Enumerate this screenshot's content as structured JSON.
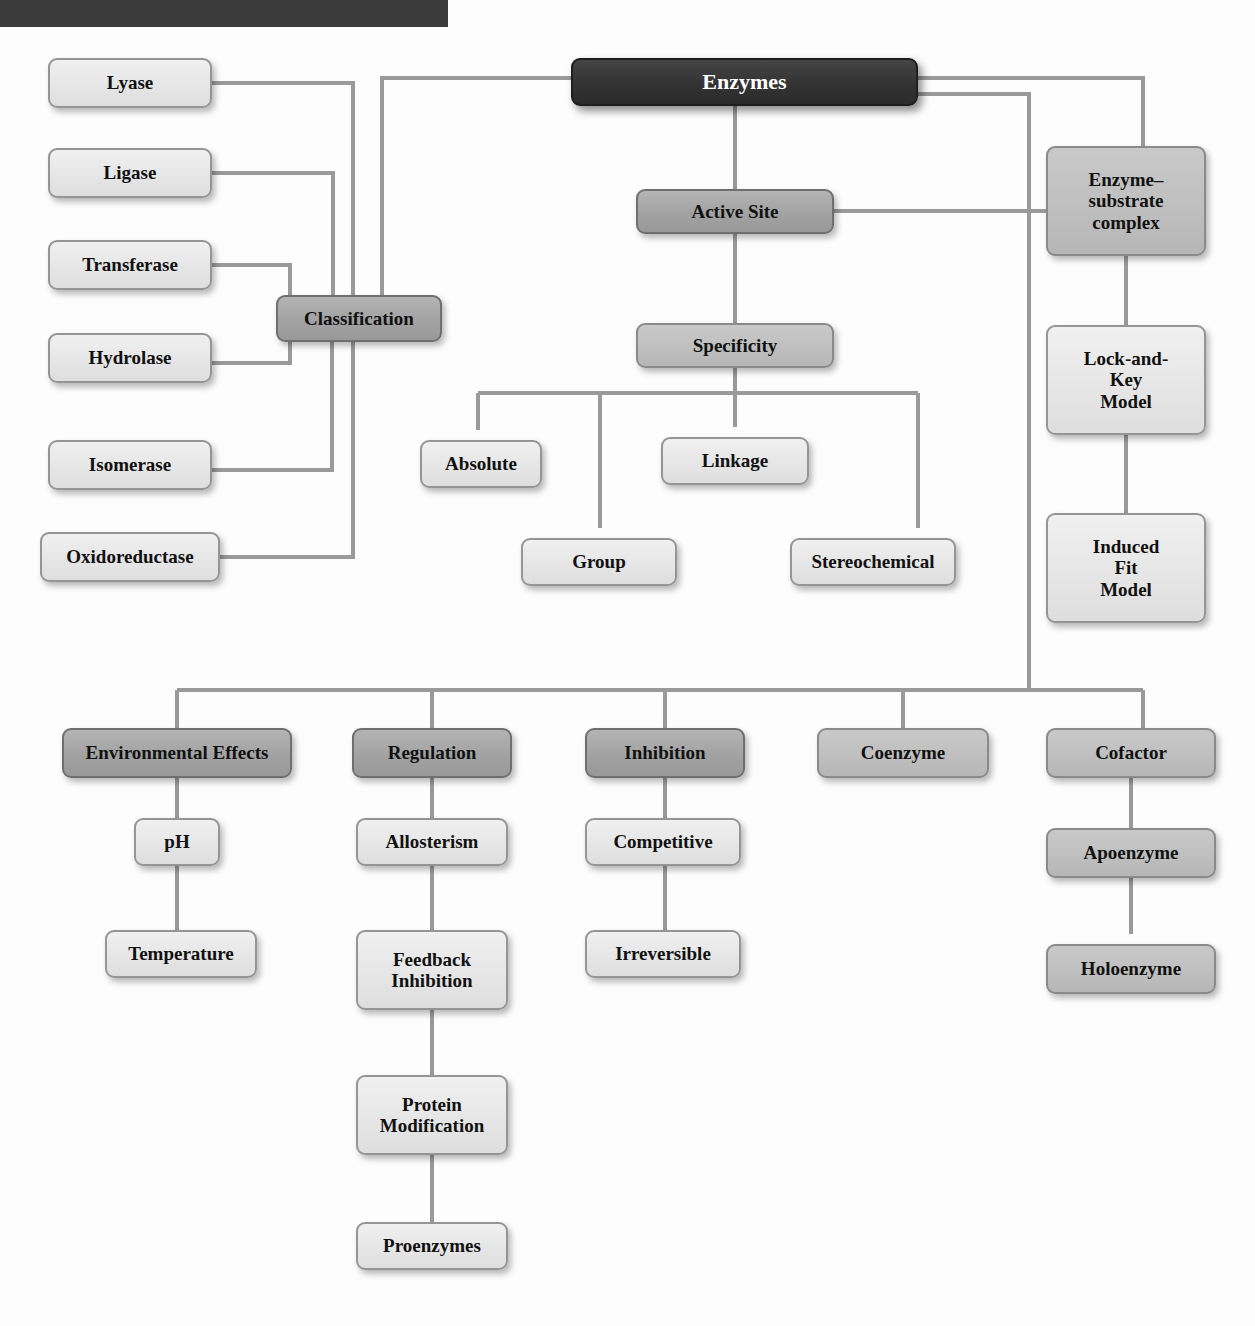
{
  "diagram": {
    "title_banner": "",
    "colors": {
      "root_fill": "#333333",
      "dark_fill": "#a2a2a2",
      "mid_fill": "#bfbfbf",
      "light_fill": "#e6e6e6",
      "connector": "#9a9a9a",
      "border": "#8e8e8e",
      "text": "#111111",
      "root_text": "#ffffff",
      "banner": "#3b3b3b"
    },
    "nodes": [
      {
        "id": "enzymes",
        "label": "Enzymes",
        "tone": "root",
        "x": 571,
        "y": 58,
        "w": 347,
        "h": 48,
        "fs": 22
      },
      {
        "id": "lyase",
        "label": "Lyase",
        "tone": "light",
        "x": 48,
        "y": 58,
        "w": 164,
        "h": 50,
        "fs": 19
      },
      {
        "id": "ligase",
        "label": "Ligase",
        "tone": "light",
        "x": 48,
        "y": 148,
        "w": 164,
        "h": 50,
        "fs": 19
      },
      {
        "id": "transferase",
        "label": "Transferase",
        "tone": "light",
        "x": 48,
        "y": 240,
        "w": 164,
        "h": 50,
        "fs": 19
      },
      {
        "id": "hydrolase",
        "label": "Hydrolase",
        "tone": "light",
        "x": 48,
        "y": 333,
        "w": 164,
        "h": 50,
        "fs": 19
      },
      {
        "id": "isomerase",
        "label": "Isomerase",
        "tone": "light",
        "x": 48,
        "y": 440,
        "w": 164,
        "h": 50,
        "fs": 19
      },
      {
        "id": "oxidoreductase",
        "label": "Oxidoreductase",
        "tone": "light",
        "x": 40,
        "y": 532,
        "w": 180,
        "h": 50,
        "fs": 19
      },
      {
        "id": "classification",
        "label": "Classification",
        "tone": "dark",
        "x": 276,
        "y": 295,
        "w": 166,
        "h": 47,
        "fs": 19
      },
      {
        "id": "active-site",
        "label": "Active Site",
        "tone": "dark",
        "x": 636,
        "y": 189,
        "w": 198,
        "h": 45,
        "fs": 19
      },
      {
        "id": "specificity",
        "label": "Specificity",
        "tone": "mid",
        "x": 636,
        "y": 323,
        "w": 198,
        "h": 45,
        "fs": 19
      },
      {
        "id": "absolute",
        "label": "Absolute",
        "tone": "light",
        "x": 420,
        "y": 440,
        "w": 122,
        "h": 48,
        "fs": 19
      },
      {
        "id": "linkage",
        "label": "Linkage",
        "tone": "light",
        "x": 661,
        "y": 437,
        "w": 148,
        "h": 48,
        "fs": 19
      },
      {
        "id": "group",
        "label": "Group",
        "tone": "light",
        "x": 521,
        "y": 538,
        "w": 156,
        "h": 48,
        "fs": 19
      },
      {
        "id": "stereochemical",
        "label": "Stereochemical",
        "tone": "light",
        "x": 790,
        "y": 538,
        "w": 166,
        "h": 48,
        "fs": 19
      },
      {
        "id": "enzyme-substrate",
        "label": "Enzyme–\nsubstrate\ncomplex",
        "tone": "mid",
        "x": 1046,
        "y": 146,
        "w": 160,
        "h": 110,
        "fs": 19
      },
      {
        "id": "lock-and-key",
        "label": "Lock-and-\nKey\nModel",
        "tone": "light",
        "x": 1046,
        "y": 325,
        "w": 160,
        "h": 110,
        "fs": 19
      },
      {
        "id": "induced-fit",
        "label": "Induced\nFit\nModel",
        "tone": "light",
        "x": 1046,
        "y": 513,
        "w": 160,
        "h": 110,
        "fs": 19
      },
      {
        "id": "environmental-effects",
        "label": "Environmental Effects",
        "tone": "dark",
        "x": 62,
        "y": 728,
        "w": 230,
        "h": 50,
        "fs": 19
      },
      {
        "id": "ph",
        "label": "pH",
        "tone": "light",
        "x": 134,
        "y": 818,
        "w": 86,
        "h": 48,
        "fs": 19
      },
      {
        "id": "temperature",
        "label": "Temperature",
        "tone": "light",
        "x": 105,
        "y": 930,
        "w": 152,
        "h": 48,
        "fs": 19
      },
      {
        "id": "regulation",
        "label": "Regulation",
        "tone": "dark",
        "x": 352,
        "y": 728,
        "w": 160,
        "h": 50,
        "fs": 19
      },
      {
        "id": "allosterism",
        "label": "Allosterism",
        "tone": "light",
        "x": 356,
        "y": 818,
        "w": 152,
        "h": 48,
        "fs": 19
      },
      {
        "id": "feedback-inhibition",
        "label": "Feedback\nInhibition",
        "tone": "light",
        "x": 356,
        "y": 930,
        "w": 152,
        "h": 80,
        "fs": 19
      },
      {
        "id": "protein-modification",
        "label": "Protein\nModification",
        "tone": "light",
        "x": 356,
        "y": 1075,
        "w": 152,
        "h": 80,
        "fs": 19
      },
      {
        "id": "proenzymes",
        "label": "Proenzymes",
        "tone": "light",
        "x": 356,
        "y": 1222,
        "w": 152,
        "h": 48,
        "fs": 19
      },
      {
        "id": "inhibition",
        "label": "Inhibition",
        "tone": "dark",
        "x": 585,
        "y": 728,
        "w": 160,
        "h": 50,
        "fs": 19
      },
      {
        "id": "competitive",
        "label": "Competitive",
        "tone": "light",
        "x": 585,
        "y": 818,
        "w": 156,
        "h": 48,
        "fs": 19
      },
      {
        "id": "irreversible",
        "label": "Irreversible",
        "tone": "light",
        "x": 585,
        "y": 930,
        "w": 156,
        "h": 48,
        "fs": 19
      },
      {
        "id": "coenzyme",
        "label": "Coenzyme",
        "tone": "mid",
        "x": 817,
        "y": 728,
        "w": 172,
        "h": 50,
        "fs": 19
      },
      {
        "id": "cofactor",
        "label": "Cofactor",
        "tone": "mid",
        "x": 1046,
        "y": 728,
        "w": 170,
        "h": 50,
        "fs": 19
      },
      {
        "id": "apoenzyme",
        "label": "Apoenzyme",
        "tone": "mid",
        "x": 1046,
        "y": 828,
        "w": 170,
        "h": 50,
        "fs": 19
      },
      {
        "id": "holoenzyme",
        "label": "Holoenzyme",
        "tone": "mid",
        "x": 1046,
        "y": 944,
        "w": 170,
        "h": 50,
        "fs": 19
      }
    ],
    "edges": [
      {
        "from": "lyase",
        "to": "classification",
        "arrow": false
      },
      {
        "from": "ligase",
        "to": "classification",
        "arrow": false
      },
      {
        "from": "transferase",
        "to": "classification",
        "arrow": false
      },
      {
        "from": "hydrolase",
        "to": "classification",
        "arrow": false
      },
      {
        "from": "isomerase",
        "to": "classification",
        "arrow": false
      },
      {
        "from": "oxidoreductase",
        "to": "classification",
        "arrow": false
      },
      {
        "from": "enzymes",
        "to": "classification",
        "arrow": false
      },
      {
        "from": "enzymes",
        "to": "active-site",
        "arrow": false
      },
      {
        "from": "enzymes",
        "to": "enzyme-substrate",
        "arrow": false
      },
      {
        "from": "enzymes",
        "to": "bottom-bus",
        "arrow": false
      },
      {
        "from": "active-site",
        "to": "specificity",
        "arrow": false
      },
      {
        "from": "active-site",
        "to": "enzyme-substrate",
        "arrow": false
      },
      {
        "from": "specificity",
        "to": "absolute",
        "arrow": true
      },
      {
        "from": "specificity",
        "to": "group",
        "arrow": true
      },
      {
        "from": "specificity",
        "to": "linkage",
        "arrow": true
      },
      {
        "from": "specificity",
        "to": "stereochemical",
        "arrow": true
      },
      {
        "from": "enzyme-substrate",
        "to": "lock-and-key",
        "arrow": false
      },
      {
        "from": "lock-and-key",
        "to": "induced-fit",
        "arrow": false
      },
      {
        "from": "bottom-bus",
        "to": "environmental-effects",
        "arrow": false
      },
      {
        "from": "bottom-bus",
        "to": "regulation",
        "arrow": false
      },
      {
        "from": "bottom-bus",
        "to": "inhibition",
        "arrow": false
      },
      {
        "from": "bottom-bus",
        "to": "coenzyme",
        "arrow": false
      },
      {
        "from": "bottom-bus",
        "to": "cofactor",
        "arrow": false
      },
      {
        "from": "environmental-effects",
        "to": "ph",
        "arrow": false
      },
      {
        "from": "ph",
        "to": "temperature",
        "arrow": false
      },
      {
        "from": "regulation",
        "to": "allosterism",
        "arrow": false
      },
      {
        "from": "allosterism",
        "to": "feedback-inhibition",
        "arrow": false
      },
      {
        "from": "feedback-inhibition",
        "to": "protein-modification",
        "arrow": false
      },
      {
        "from": "protein-modification",
        "to": "proenzymes",
        "arrow": false
      },
      {
        "from": "inhibition",
        "to": "competitive",
        "arrow": false
      },
      {
        "from": "competitive",
        "to": "irreversible",
        "arrow": false
      },
      {
        "from": "cofactor",
        "to": "apoenzyme",
        "arrow": false
      },
      {
        "from": "apoenzyme",
        "to": "holoenzyme",
        "arrow": true
      }
    ],
    "wire_paths": [
      "M212,83 H353 V295",
      "M212,173 H333 V295",
      "M212,265 H290 V295",
      "M290,342 V363 H212",
      "M332,342 V470 H212",
      "M353,342 V557 H220",
      "M571,78 H382 V295",
      "M735,106 V189",
      "M735,234 V323",
      "M834,211 H1046",
      "M918,78 H1143 V146",
      "M918,94 H1029 V690",
      "M735,368 V393",
      "M478,393 H918",
      "M478,393 V430",
      "M600,393 V528",
      "M735,393 V427",
      "M918,393 V528",
      "M1126,256 V325",
      "M1126,435 V513",
      "M177,690 H1143",
      "M177,690 V728",
      "M432,690 V728",
      "M665,690 V728",
      "M903,690 V728",
      "M1143,690 V728",
      "M177,778 V818",
      "M177,866 V930",
      "M432,778 V818",
      "M432,866 V930",
      "M432,1010 V1075",
      "M432,1155 V1222",
      "M665,778 V818",
      "M665,866 V930",
      "M1131,778 V828",
      "M1131,878 V934"
    ],
    "arrowheads": [
      {
        "x": 478,
        "y": 443
      },
      {
        "x": 600,
        "y": 541
      },
      {
        "x": 735,
        "y": 440
      },
      {
        "x": 918,
        "y": 541
      },
      {
        "x": 1131,
        "y": 947
      }
    ]
  }
}
